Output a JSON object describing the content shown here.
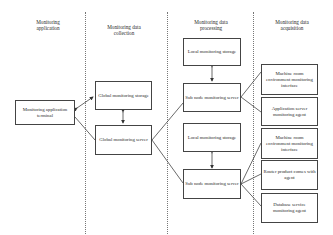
{
  "columns": [
    {
      "label_line1": "Monitoring",
      "label_line2": "application"
    },
    {
      "label_line1": "Monitoring data",
      "label_line2": "collection"
    },
    {
      "label_line1": "Monitoring data",
      "label_line2": "processing"
    },
    {
      "label_line1": "Monitoring data",
      "label_line2": "acquisition"
    }
  ],
  "boxes": {
    "app_terminal": "Monitoring application terminal",
    "global_storage": "Global monitoring storage",
    "global_server": "Global monitoring server",
    "local_storage_1": "Local monitoring storage",
    "subnode_server_1": "Sub node monitoring server",
    "local_storage_2": "Local monitoring storage",
    "subnode_server_2": "Sub node monitoring server",
    "machine_room_1": "Machine room environment monitoring interface",
    "app_server_agent": "Application server monitoring agent",
    "machine_room_2": "Machine room environment monitoring interface",
    "router_agent": "Router product comes with agent",
    "database_agent": "Database service monitoring agent"
  }
}
